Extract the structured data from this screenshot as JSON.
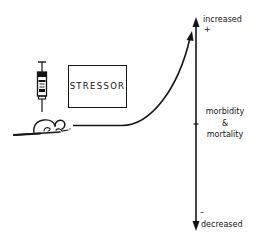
{
  "diagram": {
    "stressor_label": "STRESSOR",
    "axis": {
      "top_label": "increased",
      "top_sign": "+",
      "middle_label_line1": "morbidity",
      "middle_label_line2": "&",
      "middle_label_line3": "mortality",
      "bottom_sign": "–",
      "bottom_label": "decreased"
    },
    "icons": {
      "syringe": "syringe-icon",
      "mouse": "mouse-icon",
      "curve": "response-curve-arrow"
    },
    "colors": {
      "ink": "#151515",
      "background": "#ffffff"
    }
  }
}
